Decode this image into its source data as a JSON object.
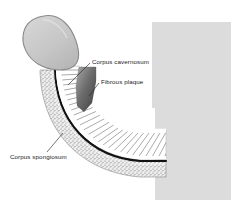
{
  "figure": {
    "type": "medical-illustration",
    "background_color": "#ffffff",
    "block_color": "#dcdcdc"
  },
  "labels": {
    "corpus_cavernosum": "Corpus cavernosum",
    "fibrous_plaque": "Fibrous plaque",
    "corpus_spongiosum": "Corpus spongiosum"
  },
  "anatomy": {
    "glans": {
      "name": "glans",
      "fill": "#c9c9c9",
      "stroke": "#8f8f8f"
    },
    "shaft": {
      "name": "shaft",
      "fill": "#ffffff",
      "hatch_color": "#9a9a9a"
    },
    "tunica": {
      "name": "tunica-albuginea",
      "stroke": "#111111"
    },
    "spongiosum_band": {
      "name": "corpus-spongiosum-band",
      "stipple_color": "#707070",
      "fill": "#e8e8e8"
    },
    "plaque": {
      "name": "fibrous-plaque",
      "fill_dark": "#4a4a4a",
      "fill_light": "#9e9e9e"
    }
  },
  "leader_lines": {
    "color": "#2a2a2a",
    "width": 0.6
  }
}
